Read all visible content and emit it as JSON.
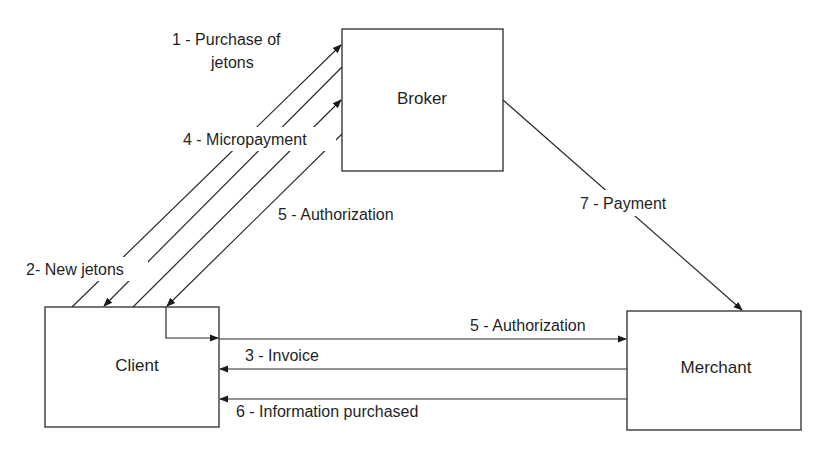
{
  "diagram": {
    "nodes": {
      "broker": {
        "label": "Broker"
      },
      "client": {
        "label": "Client"
      },
      "merchant": {
        "label": "Merchant"
      }
    },
    "edges": {
      "purchase_of_jetons": {
        "label_line1": "1 - Purchase of",
        "label_line2": "jetons",
        "from": "Client",
        "to": "Broker"
      },
      "new_jetons": {
        "label": "2- New jetons",
        "from": "Broker",
        "to": "Client"
      },
      "invoice": {
        "label": "3 - Invoice",
        "from": "Merchant",
        "to": "Client"
      },
      "micropayment": {
        "label": "4 - Micropayment",
        "from": "Client",
        "to": "Broker"
      },
      "authorization_broker_client": {
        "label": "5 - Authorization",
        "from": "Broker",
        "to": "Client"
      },
      "authorization_client_merchant": {
        "label": "5 - Authorization",
        "from": "Client",
        "to": "Merchant"
      },
      "information_purchased": {
        "label": "6 - Information purchased",
        "from": "Merchant",
        "to": "Client"
      },
      "payment": {
        "label": "7 - Payment",
        "from": "Broker",
        "to": "Merchant"
      }
    },
    "colors": {
      "stroke": "#2b2b2b",
      "text": "#1f1f1f",
      "background": "#ffffff"
    }
  }
}
